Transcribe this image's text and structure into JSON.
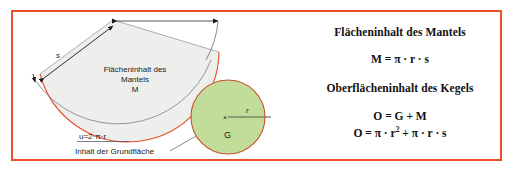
{
  "panel": {
    "border_color": "#e8502a",
    "background": "#ffffff"
  },
  "diagram": {
    "sector": {
      "fill_color": "#eeeeec",
      "arc_color": "#e8502a",
      "label_line1": "Flächeninhalt des",
      "label_line2": "Mantels",
      "label_line3": "M"
    },
    "slant_label": "s",
    "arc_length_label": "u=2·π·r",
    "base_area_caption": "Inhalt der Grundfläche",
    "circle": {
      "fill_color": "#c2dd9a",
      "stroke_color": "#c8502a",
      "label": "G",
      "radius_label": "r",
      "center_marker": "×"
    }
  },
  "formulas": {
    "title_mantel": "Flächeninhalt des Mantels",
    "eq_mantel": "M = π · r · s",
    "title_kegel": "Oberflächeninhalt des Kegels",
    "eq_o_sum": "O = G + M",
    "eq_o_full_prefix": "O = π · r",
    "eq_o_full_exp": "2",
    "eq_o_full_suffix": " + π · r · s"
  }
}
